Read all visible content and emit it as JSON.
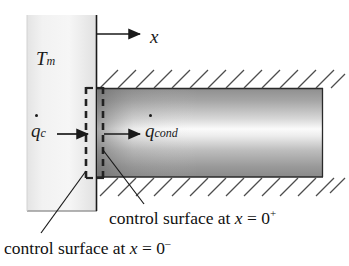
{
  "figure": {
    "width": 349,
    "height": 266,
    "background": "#ffffff"
  },
  "labels": {
    "temperature": {
      "symbol": "T",
      "subscript": "m",
      "name": "melt-temperature"
    },
    "axis": {
      "symbol": "x",
      "name": "x-axis"
    },
    "flux_convective": {
      "symbol": "q",
      "subscript": "c",
      "dot": true,
      "name": "heat-flux-c"
    },
    "flux_conduction": {
      "symbol": "q",
      "subscript": "cond",
      "dot": true,
      "name": "heat-flux-cond"
    }
  },
  "captions": {
    "plus": {
      "prefix": "control surface at ",
      "variable": "x",
      "equals": " = 0",
      "sign": "+"
    },
    "minus": {
      "prefix": "control surface at ",
      "variable": "x",
      "equals": " = 0",
      "sign": "–"
    }
  },
  "colors": {
    "line": "#1a1a1a",
    "hatch": "#555555",
    "solid_block_light": "#f3f3f3",
    "solid_block_dark": "#d9d9d9",
    "bar_edge_dark": "#6e6e6e",
    "bar_core_light": "#fbfbfb",
    "dashed": "#2b2b2b"
  },
  "geometry": {
    "solid_block": {
      "x": 27,
      "y": 15,
      "width": 70,
      "height": 196
    },
    "wall_line_x": 96,
    "bar": {
      "x": 97,
      "y": 88,
      "width": 226,
      "height": 89
    },
    "hatch_top_y": 88,
    "hatch_bottom_y": 177,
    "control_surface_minus_x": 86,
    "control_surface_plus_x": 103,
    "control_surface_top": 87,
    "control_surface_bottom": 179
  },
  "elements": {
    "axis_arrow": {
      "from_x": 96,
      "to_x": 141,
      "y": 34,
      "name": "x-axis-arrow"
    },
    "qc_arrow": {
      "from_x": 57,
      "to_x": 88,
      "y": 134,
      "name": "qc-arrow"
    },
    "qcond_arrow": {
      "from_x": 104,
      "to_x": 140,
      "y": 134,
      "name": "qcond-arrow"
    },
    "leader_minus": {
      "from_x": 86,
      "from_y": 172,
      "to_x": 41,
      "to_y": 233,
      "name": "leader-line-minus"
    },
    "leader_plus": {
      "from_x": 103,
      "from_y": 152,
      "to_x": 143,
      "to_y": 205,
      "name": "leader-line-plus"
    }
  }
}
